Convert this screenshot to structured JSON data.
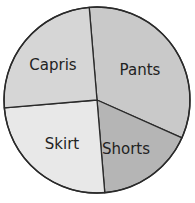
{
  "chart_data": {
    "type": "pie",
    "title": "",
    "start_angle_deg_clockwise_from_top": -4.8,
    "categories": [
      "Pants",
      "Shorts",
      "Skirt",
      "Capris"
    ],
    "values": [
      33,
      17,
      25,
      25
    ],
    "colors": [
      "#c9c9c9",
      "#b5b5b5",
      "#e8e8e8",
      "#d6d6d6"
    ],
    "labels_inside": true,
    "legend": "none",
    "label_positions": [
      {
        "label": "Pants",
        "x": 140,
        "y": 70
      },
      {
        "label": "Shorts",
        "x": 126,
        "y": 149
      },
      {
        "label": "Skirt",
        "x": 62,
        "y": 144
      },
      {
        "label": "Capris",
        "x": 53,
        "y": 65
      }
    ]
  },
  "geometry": {
    "cx": 97,
    "cy": 100,
    "r": 93
  }
}
